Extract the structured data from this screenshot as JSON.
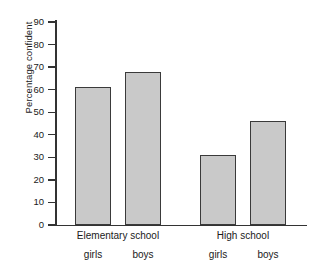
{
  "chart_data": {
    "type": "bar",
    "title": "",
    "xlabel": "",
    "ylabel": "Percentage confident",
    "ylim": [
      0,
      90
    ],
    "ytick_step": 10,
    "yticks": [
      90,
      80,
      70,
      60,
      50,
      40,
      30,
      20,
      10,
      0
    ],
    "grid": false,
    "legend": "none",
    "groups": [
      {
        "name": "Elementary school",
        "categories": [
          "girls",
          "boys"
        ],
        "values": [
          61,
          68
        ]
      },
      {
        "name": "High school",
        "categories": [
          "girls",
          "boys"
        ],
        "values": [
          31,
          46
        ]
      }
    ],
    "categories": [
      "Elementary school girls",
      "Elementary school boys",
      "High school girls",
      "High school boys"
    ],
    "values": [
      61,
      68,
      31,
      46
    ],
    "bar_fill_color": "#c9c9c9",
    "bar_edge_color": "#3a3a3a",
    "axis_color": "#333333"
  },
  "bars": [
    {
      "label": "girls",
      "value": 61,
      "group": "Elementary school"
    },
    {
      "label": "boys",
      "value": 68,
      "group": "Elementary school"
    },
    {
      "label": "girls",
      "value": 31,
      "group": "High school"
    },
    {
      "label": "boys",
      "value": 46,
      "group": "High school"
    }
  ],
  "axis": {
    "y_title": "Percentage confident",
    "ticks": [
      "90",
      "80",
      "70",
      "60",
      "50",
      "40",
      "30",
      "20",
      "10",
      "0"
    ]
  },
  "groups": [
    {
      "name": "Elementary school"
    },
    {
      "name": "High school"
    }
  ]
}
